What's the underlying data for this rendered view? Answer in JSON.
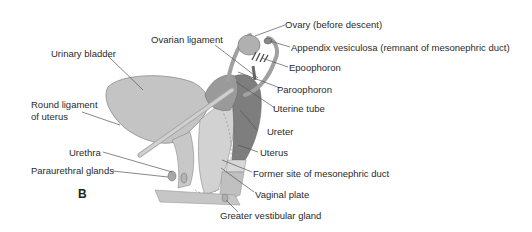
{
  "figure": {
    "panel_label": "B",
    "colors": {
      "structure_fill": "#bdbdbd",
      "structure_dark": "#8e8e8e",
      "uterus_fill": "#7c7c7c",
      "leader_line": "#555555",
      "text": "#2a2a2a"
    },
    "labels": [
      {
        "id": "ovary",
        "text": "Ovary (before descent)"
      },
      {
        "id": "appendix-vesiculosa",
        "text": "Appendix vesiculosa (remnant of mesonephric duct)"
      },
      {
        "id": "ovarian-ligament",
        "text": "Ovarian ligament"
      },
      {
        "id": "epoophoron",
        "text": "Epoophoron"
      },
      {
        "id": "urinary-bladder",
        "text": "Urinary bladder"
      },
      {
        "id": "paroophoron",
        "text": "Paroophoron"
      },
      {
        "id": "uterine-tube",
        "text": "Uterine tube"
      },
      {
        "id": "round-ligament-1",
        "text": "Round ligament"
      },
      {
        "id": "round-ligament-2",
        "text": "of uterus"
      },
      {
        "id": "ureter",
        "text": "Ureter"
      },
      {
        "id": "urethra",
        "text": "Urethra"
      },
      {
        "id": "uterus",
        "text": "Uterus"
      },
      {
        "id": "paraurethral-glands",
        "text": "Paraurethral glands"
      },
      {
        "id": "mesonephric-site",
        "text": "Former site of mesonephric duct"
      },
      {
        "id": "vaginal-plate",
        "text": "Vaginal plate"
      },
      {
        "id": "greater-vestibular-gland",
        "text": "Greater vestibular gland"
      }
    ]
  }
}
